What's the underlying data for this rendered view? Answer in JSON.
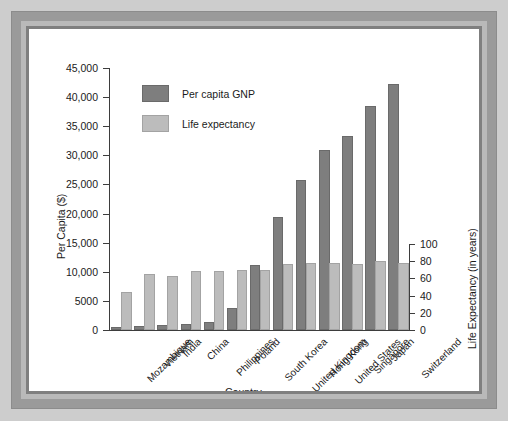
{
  "chart_data": {
    "type": "bar",
    "title": "",
    "xlabel": "Country",
    "ylabel": "Per Capita ($)",
    "y2label": "Life Expectancy (in years)",
    "grid": false,
    "legend_position": "top-left-inside",
    "categories": [
      "Mozambique",
      "Vietnam",
      "India",
      "China",
      "Philippines",
      "Poland",
      "South Korea",
      "United Kingdom",
      "Hong Kong",
      "United States",
      "Singapore",
      "Japan",
      "Switzerland"
    ],
    "yticks": [
      "0",
      "5000",
      "10,000",
      "15,000",
      "20,000",
      "25,000",
      "30,000",
      "35,000",
      "40,000",
      "45,000"
    ],
    "ytick_values": [
      0,
      5000,
      10000,
      15000,
      20000,
      25000,
      30000,
      35000,
      40000,
      45000
    ],
    "ylim": [
      0,
      45000
    ],
    "y2ticks": [
      "0",
      "20",
      "40",
      "60",
      "80",
      "100"
    ],
    "y2tick_values": [
      0,
      20,
      40,
      60,
      80,
      100
    ],
    "y2lim": [
      0,
      100
    ],
    "series": [
      {
        "name": "Per capita GNP",
        "axis": "left",
        "color": "#7e7e7e",
        "values": [
          210,
          330,
          440,
          750,
          1050,
          3400,
          10800,
          19000,
          25400,
          30600,
          32900,
          38200,
          42000
        ]
      },
      {
        "name": "Life expectancy",
        "axis": "right",
        "color": "#bcbcbc",
        "values": [
          42,
          63,
          60,
          66,
          66,
          67,
          68,
          75,
          76,
          76,
          75,
          78,
          76
        ]
      }
    ]
  },
  "legend": {
    "items": [
      {
        "label": "Per capita GNP",
        "swatch": "gnp"
      },
      {
        "label": "Life expectancy",
        "swatch": "life"
      }
    ]
  },
  "colors": {
    "gnp_bar": "#7e7e7e",
    "life_bar": "#bcbcbc",
    "axis": "#3d3d3d",
    "frame_outer": "#9a9a9a",
    "frame_inner": "#7f7f7f",
    "page_background": "#cdcdcd",
    "plot_background": "#ffffff"
  }
}
